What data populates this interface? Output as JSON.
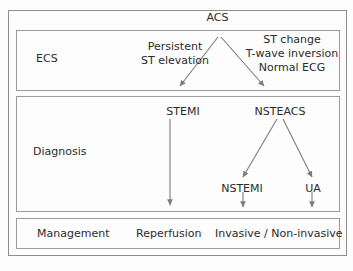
{
  "diagram": {
    "title": "ACS",
    "type": "flowchart",
    "rows": [
      {
        "id": "ecs",
        "label": "ECS"
      },
      {
        "id": "diagnosis",
        "label": "Diagnosis"
      },
      {
        "id": "management",
        "label": "Management"
      }
    ],
    "nodes": {
      "acs": "ACS",
      "persistent_st_elevation": "Persistent\nST elevation",
      "st_change_block": "ST change\nT-wave inversion\nNormal ECG",
      "stemi": "STEMI",
      "nsteacs": "NSTEACS",
      "nstemi": "NSTEMI",
      "ua": "UA",
      "reperfusion": "Reperfusion",
      "invasive": "Invasive / Non-invasive"
    },
    "edges": [
      {
        "from": "acs",
        "to": "persistent_st_elevation"
      },
      {
        "from": "acs",
        "to": "st_change_block"
      },
      {
        "from": "stemi",
        "to": "reperfusion"
      },
      {
        "from": "nsteacs",
        "to": "nstemi"
      },
      {
        "from": "nsteacs",
        "to": "ua"
      },
      {
        "from": "nstemi",
        "to": "invasive"
      },
      {
        "from": "ua",
        "to": "invasive"
      }
    ],
    "colors": {
      "background": "#fdfdfd",
      "text": "#2b2b2b",
      "border": "#9a9a9a",
      "arrow": "#7d7d7d"
    }
  }
}
